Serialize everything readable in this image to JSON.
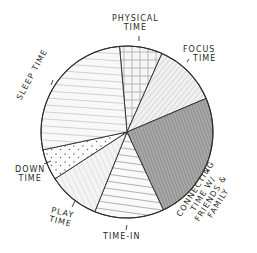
{
  "chart_data": {
    "type": "pie",
    "title": "",
    "style": "hand-drawn pencil sketch",
    "unit": "approximate share of day (%)",
    "legend": "none (labels placed around the pie)",
    "center": [
      127,
      132
    ],
    "radius": 86,
    "start_angle_deg": -5,
    "slices": [
      {
        "label": "Physical Time",
        "lines": [
          "PHYSICAL",
          "TIME"
        ],
        "value": 8,
        "start": -5,
        "end": 24,
        "pattern": "crosshatch",
        "shade": "#f2f2f2"
      },
      {
        "label": "Focus Time",
        "lines": [
          "FOCUS",
          "TIME"
        ],
        "value": 12,
        "start": 24,
        "end": 67,
        "pattern": "diagonal",
        "shade": "#ececec"
      },
      {
        "label": "Connecting Time w/ Friends & Family",
        "lines": [
          "CONNECTING",
          "TIME w/",
          "FRIENDS &",
          "FAMILY"
        ],
        "value": 24.5,
        "start": 67,
        "end": 155,
        "pattern": "dense-shaded",
        "shade": "#a6a6a6"
      },
      {
        "label": "Time-In",
        "lines": [
          "TIME-IN"
        ],
        "value": 13,
        "start": 155,
        "end": 202,
        "pattern": "horizontal",
        "shade": "#f7f7f7"
      },
      {
        "label": "Play Time",
        "lines": [
          "PLAY",
          "TIME"
        ],
        "value": 9.7,
        "start": 202,
        "end": 237,
        "pattern": "diagonal-light",
        "shade": "#efefef"
      },
      {
        "label": "Down Time",
        "lines": [
          "DOWN",
          "TIME"
        ],
        "value": 5.8,
        "start": 237,
        "end": 258,
        "pattern": "dots",
        "shade": "#fafafa"
      },
      {
        "label": "Sleep Time",
        "lines": [
          "SLEEP TIME"
        ],
        "value": 27,
        "start": 258,
        "end": 355,
        "pattern": "horizontal-light",
        "shade": "#f5f5f5"
      }
    ]
  },
  "labels": {
    "physical": {
      "l1": "PHYSICAL",
      "l2": "TIME"
    },
    "focus": {
      "l1": "FOCUS",
      "l2": "TIME"
    },
    "connecting": {
      "l1": "CONNECTING",
      "l2": "TIME w/",
      "l3": "FRIENDS &",
      "l4": "FAMILY"
    },
    "timein": {
      "l1": "TIME-IN"
    },
    "play": {
      "l1": "PLAY",
      "l2": "TIME"
    },
    "down": {
      "l1": "DOWN",
      "l2": "TIME"
    },
    "sleep": {
      "l1": "SLEEP TIME"
    }
  },
  "colors": {
    "stroke": "#2b2b2b",
    "hatch": "#8a8a8a",
    "text": "#2a2a2a"
  }
}
